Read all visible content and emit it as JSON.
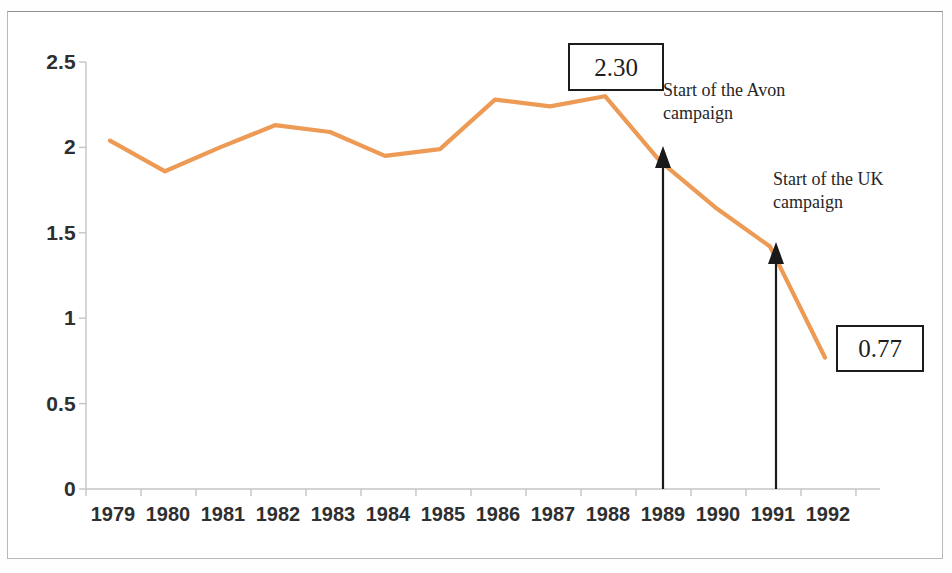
{
  "chart_data": {
    "type": "line",
    "title": "",
    "subtitle": "",
    "xlabel": "",
    "ylabel": "",
    "categories": [
      "1979",
      "1980",
      "1981",
      "1982",
      "1983",
      "1984",
      "1985",
      "1986",
      "1987",
      "1988",
      "1989",
      "1990",
      "1991",
      "1992"
    ],
    "x": [
      1979,
      1980,
      1981,
      1982,
      1983,
      1984,
      1985,
      1986,
      1987,
      1988,
      1989,
      1990,
      1991,
      1992
    ],
    "series": [
      {
        "name": "value",
        "color": "#ED9A54",
        "values": [
          2.04,
          1.86,
          2.0,
          2.13,
          2.09,
          1.95,
          1.99,
          2.28,
          2.24,
          2.3,
          1.92,
          1.65,
          1.42,
          0.77
        ]
      }
    ],
    "ylim": [
      0,
      2.5
    ],
    "yticks": [
      0,
      0.5,
      1,
      1.5,
      2,
      2.5
    ],
    "ytick_labels": [
      "0",
      "0.5",
      "1",
      "1.5",
      "2",
      "2.5"
    ],
    "xtick_labels": [
      "1979",
      "1980",
      "1981",
      "1982",
      "1983",
      "1984",
      "1985",
      "1986",
      "1987",
      "1988",
      "1989",
      "1990",
      "1991",
      "1992"
    ],
    "grid": false,
    "legend": "none",
    "annotations": [
      {
        "id": "peak-value",
        "kind": "value-box",
        "text": "2.30",
        "points_to_year": 1988,
        "points_to_value": 2.3
      },
      {
        "id": "end-value",
        "kind": "value-box",
        "text": "0.77",
        "points_to_year": 1992,
        "points_to_value": 0.77
      },
      {
        "id": "avon-campaign",
        "kind": "arrow-label",
        "text": "Start of the Avon\ncampaign",
        "arrow_at_year": 1989,
        "arrow_from_value": 0,
        "arrow_to_value": 1.95
      },
      {
        "id": "uk-campaign",
        "kind": "arrow-label",
        "text": "Start of the UK\ncampaign",
        "arrow_at_year": 1991,
        "arrow_from_value": 0,
        "arrow_to_value": 1.42
      }
    ]
  },
  "chart": {
    "line_color": "#ED9A54",
    "axis_color": "#c2c2c2",
    "tick_label_color": "#2f2f2f",
    "annotation_color": "#262626",
    "box_border_color": "#1c1c1c",
    "arrow_color": "#1a1a1a",
    "background": "#ffffff",
    "page_border_color": "#b9b9bb"
  },
  "annotations": {
    "peak_value_label": "2.30",
    "end_value_label": "0.77",
    "avon_label": "Start of the Avon\ncampaign",
    "uk_label": "Start of the UK\ncampaign"
  }
}
